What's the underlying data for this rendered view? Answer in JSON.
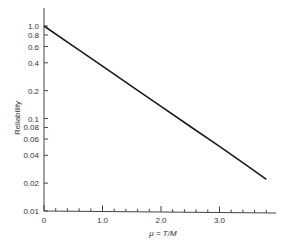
{
  "chart_data": {
    "type": "line",
    "title": "",
    "xlabel": "μ = T/M",
    "ylabel": "Reliability",
    "x_scale": "linear",
    "y_scale": "log",
    "xlim": [
      0,
      3.95
    ],
    "ylim": [
      0.01,
      1.0
    ],
    "grid": false,
    "legend": null,
    "x_ticks": [
      {
        "value": 0,
        "label": "0"
      },
      {
        "value": 1.0,
        "label": "1.0"
      },
      {
        "value": 2.0,
        "label": "2.0"
      },
      {
        "value": 3.0,
        "label": "3.0"
      }
    ],
    "x_minor_step": 0.2,
    "y_ticks": [
      {
        "value": 1.0,
        "label": "1.0"
      },
      {
        "value": 0.8,
        "label": "0.8"
      },
      {
        "value": 0.6,
        "label": "0.6"
      },
      {
        "value": 0.4,
        "label": "0.4"
      },
      {
        "value": 0.2,
        "label": "0.2"
      },
      {
        "value": 0.1,
        "label": "0.1"
      },
      {
        "value": 0.08,
        "label": "0.08"
      },
      {
        "value": 0.06,
        "label": "0.06"
      },
      {
        "value": 0.04,
        "label": "0.04"
      },
      {
        "value": 0.02,
        "label": "0.02"
      },
      {
        "value": 0.01,
        "label": "0.01"
      }
    ],
    "series": [
      {
        "name": "R = exp(-μ)",
        "x": [
          0,
          0.5,
          1.0,
          1.5,
          2.0,
          2.5,
          3.0,
          3.5,
          3.8
        ],
        "y": [
          1.0,
          0.607,
          0.368,
          0.223,
          0.135,
          0.082,
          0.05,
          0.03,
          0.022
        ]
      }
    ]
  }
}
